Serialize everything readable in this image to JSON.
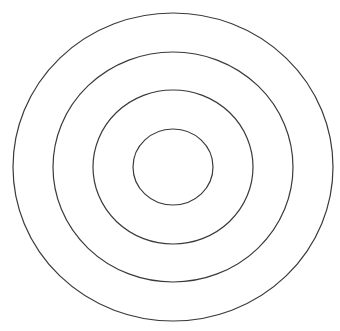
{
  "diagram": {
    "type": "concentric-circles",
    "stroke_color": "#3a3a3a",
    "background": "#ffffff",
    "center": {
      "x": 173,
      "y": 167
    },
    "rings": [
      {
        "name": "outer-ring",
        "rx": 160,
        "ry": 154
      },
      {
        "name": "second-ring",
        "rx": 120,
        "ry": 115
      },
      {
        "name": "third-ring",
        "rx": 80,
        "ry": 77
      },
      {
        "name": "inner-ring",
        "rx": 40,
        "ry": 38
      }
    ]
  }
}
